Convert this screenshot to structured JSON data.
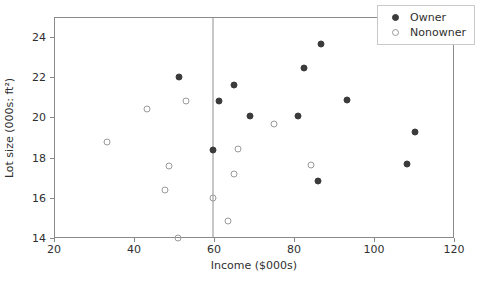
{
  "chart_data": {
    "type": "scatter",
    "title": "",
    "xlabel": "Income ($000s)",
    "ylabel": "Lot size (000s: ft²)",
    "xlim": [
      20,
      120
    ],
    "ylim": [
      14,
      25
    ],
    "xticks": [
      20,
      40,
      60,
      80,
      100,
      120
    ],
    "yticks": [
      14,
      16,
      18,
      20,
      22,
      24
    ],
    "grid": false,
    "legend_position": "upper right",
    "annotations": [
      {
        "type": "vertical-line",
        "x": 59.4,
        "label": ""
      }
    ],
    "series": [
      {
        "name": "Owner",
        "marker": "filled-circle",
        "color": "#3b3b3b",
        "points": [
          {
            "x": 51.0,
            "y": 22.05
          },
          {
            "x": 59.4,
            "y": 18.45
          },
          {
            "x": 61.0,
            "y": 20.85
          },
          {
            "x": 64.8,
            "y": 21.65
          },
          {
            "x": 68.8,
            "y": 20.1
          },
          {
            "x": 80.8,
            "y": 20.1
          },
          {
            "x": 82.3,
            "y": 22.5
          },
          {
            "x": 86.6,
            "y": 23.7
          },
          {
            "x": 85.8,
            "y": 16.9
          },
          {
            "x": 93.0,
            "y": 20.9
          },
          {
            "x": 108.0,
            "y": 17.75
          },
          {
            "x": 110.0,
            "y": 19.35
          }
        ]
      },
      {
        "name": "Nonowner",
        "marker": "open-circle",
        "color": "#9a9a9a",
        "points": [
          {
            "x": 33.0,
            "y": 18.85
          },
          {
            "x": 43.0,
            "y": 20.45
          },
          {
            "x": 47.5,
            "y": 16.45
          },
          {
            "x": 48.5,
            "y": 17.65
          },
          {
            "x": 50.7,
            "y": 14.05
          },
          {
            "x": 52.8,
            "y": 20.85
          },
          {
            "x": 59.4,
            "y": 16.05
          },
          {
            "x": 63.3,
            "y": 14.9
          },
          {
            "x": 64.8,
            "y": 17.25
          },
          {
            "x": 65.8,
            "y": 18.5
          },
          {
            "x": 74.8,
            "y": 19.7
          },
          {
            "x": 84.0,
            "y": 17.7
          }
        ]
      }
    ]
  },
  "legend": {
    "entries": [
      {
        "label": "Owner",
        "marker": "filled-circle"
      },
      {
        "label": "Nonowner",
        "marker": "open-circle"
      }
    ]
  }
}
